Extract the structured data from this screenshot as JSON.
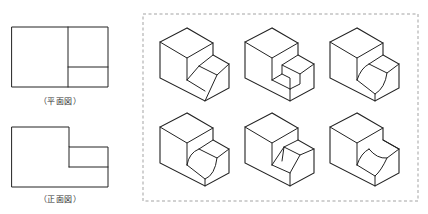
{
  "views": {
    "plan": {
      "caption": "（平面図）",
      "outer": {
        "x": 12,
        "y": 27,
        "w": 96,
        "h": 60
      },
      "lines": [
        [
          68,
          27,
          68,
          87
        ],
        [
          68,
          67,
          108,
          67
        ]
      ],
      "caption_pos": {
        "x": 60,
        "y": 95
      }
    },
    "front": {
      "caption": "（正面図）",
      "outline": "M12,127 L69,127 L69,147 L108,147 L108,187 L12,187 Z",
      "lines": [
        [
          69,
          147,
          69,
          167
        ],
        [
          69,
          167,
          108,
          167
        ]
      ],
      "caption_pos": {
        "x": 60,
        "y": 193
      }
    }
  },
  "choices_box": {
    "x": 143,
    "y": 14,
    "w": 275,
    "h": 187
  },
  "choices": [
    {
      "id": "choice-1",
      "ox": 187,
      "oy": 28,
      "variant": "chamfer-slope"
    },
    {
      "id": "choice-2",
      "ox": 272,
      "oy": 28,
      "variant": "stair-step"
    },
    {
      "id": "choice-3",
      "ox": 357,
      "oy": 28,
      "variant": "concave-arc"
    },
    {
      "id": "choice-4",
      "ox": 187,
      "oy": 113,
      "variant": "convex-arc"
    },
    {
      "id": "choice-5",
      "ox": 272,
      "oy": 113,
      "variant": "v-notch"
    },
    {
      "id": "choice-6",
      "ox": 357,
      "oy": 113,
      "variant": "concave-groove"
    }
  ],
  "base_block": {
    "outline": "M0,0 L-27,14 L-27,50 L18,73 L42,60 L42,36 L26,27 L26,15 Z",
    "edges": "M-27,14 L0,30 L26,15 M0,30 L0,52"
  },
  "variants": {
    "chamfer-slope": "M0,52 L12,38 L26,27 M12,38 L30,47 L42,36 M30,47 L18,73 M0,52 L18,63",
    "stair-step": "M0,52 L10,46 L10,37 L26,27 M10,37 L28,46 L42,36 M28,46 L28,56 L18,61 L18,73 M10,46 L18,50 L18,61 M0,52 L18,61",
    "concave-arc": "M0,52 Q4,40 12,36 L26,27 M12,36 L30,45 L42,36 M30,45 Q28,60 18,66 L18,73 M0,52 L18,66",
    "convex-arc": "M0,52 Q2,40 12,36 L26,27 M12,36 L30,45 L42,36 M30,45 Q28,62 18,66 L18,73 M0,52 L18,66",
    "v-notch": "M0,52 L12,34 L26,27 M12,34 L28,42 L42,36 M28,42 L18,60 L18,73 M0,52 L18,60 M12,34 L10,48",
    "concave-groove": "M0,52 Q4,40 12,36 M12,36 Q20,46 30,45 L42,36 M26,27 L42,36 M30,45 Q24,58 18,63 L18,73 M0,52 L18,63"
  }
}
